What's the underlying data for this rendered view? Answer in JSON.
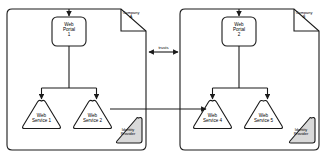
{
  "diagram": {
    "type": "architecture-diagram",
    "background_color": "#ffffff",
    "line_color": "#1a1a1a",
    "shade_color": "#d9d9d9"
  },
  "boundaries": [
    {
      "id": "company-a",
      "corner_label_line1": "Company",
      "corner_label_line2": "A"
    },
    {
      "id": "company-b",
      "corner_label_line1": "Company",
      "corner_label_line2": "B"
    }
  ],
  "nodes": {
    "portal_a": {
      "line1": "Web",
      "line2": "Portal",
      "line3": "1"
    },
    "portal_b": {
      "line1": "Web",
      "line2": "Portal",
      "line3": "2"
    },
    "service_1": {
      "line1": "Web",
      "line2": "Service 1"
    },
    "service_2": {
      "line1": "Web",
      "line2": "Service 2"
    },
    "service_4": {
      "line1": "Web",
      "line2": "Service 4"
    },
    "service_5": {
      "line1": "Web",
      "line2": "Service 5"
    },
    "idp_a": {
      "line1": "Identity",
      "line2": "Provider"
    },
    "idp_b": {
      "line1": "Identity",
      "line2": "Provider"
    }
  },
  "edges": {
    "trusts_label": "trusts"
  }
}
